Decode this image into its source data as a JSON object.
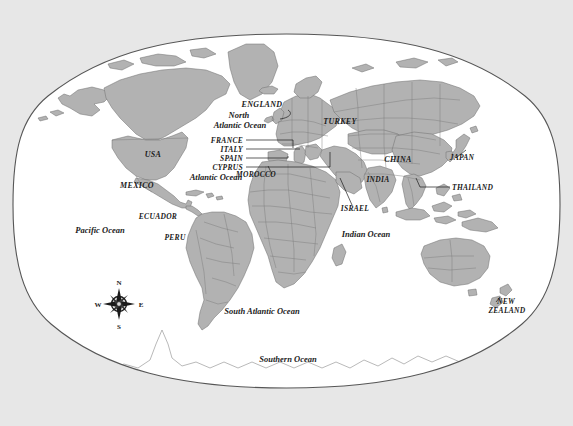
{
  "figure": {
    "kind": "world-map",
    "projection_style": "elliptical-curved-boundary",
    "background_color": "#e7e7e7",
    "ocean_color": "#ffffff",
    "land_color": "#b2b2b2",
    "land_stroke_color": "#6f6f6f",
    "border_stroke_color": "#7a7a7a",
    "boundary_stroke_color": "#565656",
    "label_color": "#1a1a1a"
  },
  "ocean_labels": [
    {
      "id": "north-atlantic-ocean",
      "lines": [
        "North",
        "Atlantic Ocean"
      ],
      "x": 240,
      "y": 118,
      "size": 8.5
    },
    {
      "id": "atlantic-ocean",
      "lines": [
        "Atlantic Ocean"
      ],
      "x": 216,
      "y": 180,
      "size": 8.5
    },
    {
      "id": "pacific-ocean",
      "lines": [
        "Pacific Ocean"
      ],
      "x": 100,
      "y": 233,
      "size": 8.5
    },
    {
      "id": "indian-ocean",
      "lines": [
        "Indian Ocean"
      ],
      "x": 366,
      "y": 237,
      "size": 8.5
    },
    {
      "id": "south-atlantic-ocean",
      "lines": [
        "South Atlantic Ocean"
      ],
      "x": 262,
      "y": 314,
      "size": 8.5
    },
    {
      "id": "southern-ocean",
      "lines": [
        "Southern Ocean"
      ],
      "x": 288,
      "y": 362,
      "size": 8.5
    }
  ],
  "country_labels": [
    {
      "id": "england",
      "lines": [
        "ENGLAND"
      ],
      "x": 262,
      "y": 107,
      "size": 8,
      "anchor": "middle"
    },
    {
      "id": "turkey",
      "lines": [
        "TURKEY"
      ],
      "x": 340,
      "y": 124,
      "size": 8,
      "anchor": "middle"
    },
    {
      "id": "france",
      "lines": [
        "FRANCE"
      ],
      "x": 243,
      "y": 143,
      "size": 7.5,
      "anchor": "end"
    },
    {
      "id": "italy",
      "lines": [
        "ITALY"
      ],
      "x": 243,
      "y": 152,
      "size": 7.5,
      "anchor": "end"
    },
    {
      "id": "spain",
      "lines": [
        "SPAIN"
      ],
      "x": 243,
      "y": 161,
      "size": 7.5,
      "anchor": "end"
    },
    {
      "id": "cyprus",
      "lines": [
        "CYPRUS"
      ],
      "x": 243,
      "y": 170,
      "size": 7.5,
      "anchor": "end"
    },
    {
      "id": "morocco",
      "lines": [
        "MOROCCO"
      ],
      "x": 256,
      "y": 177,
      "size": 7.5,
      "anchor": "middle"
    },
    {
      "id": "usa",
      "lines": [
        "USA"
      ],
      "x": 153,
      "y": 157,
      "size": 8,
      "anchor": "middle"
    },
    {
      "id": "mexico",
      "lines": [
        "MEXICO"
      ],
      "x": 137,
      "y": 188,
      "size": 8,
      "anchor": "middle"
    },
    {
      "id": "ecuador",
      "lines": [
        "ECUADOR"
      ],
      "x": 158,
      "y": 219,
      "size": 7.5,
      "anchor": "middle"
    },
    {
      "id": "peru",
      "lines": [
        "PERU"
      ],
      "x": 175,
      "y": 240,
      "size": 7.5,
      "anchor": "middle"
    },
    {
      "id": "israel",
      "lines": [
        "ISRAEL"
      ],
      "x": 355,
      "y": 211,
      "size": 7.5,
      "anchor": "middle"
    },
    {
      "id": "india",
      "lines": [
        "INDIA"
      ],
      "x": 378,
      "y": 182,
      "size": 7.5,
      "anchor": "middle"
    },
    {
      "id": "china",
      "lines": [
        "CHINA"
      ],
      "x": 398,
      "y": 162,
      "size": 8,
      "anchor": "middle"
    },
    {
      "id": "japan",
      "lines": [
        "JAPAN"
      ],
      "x": 462,
      "y": 160,
      "size": 7.5,
      "anchor": "middle"
    },
    {
      "id": "thailand",
      "lines": [
        "THAILAND"
      ],
      "x": 452,
      "y": 190,
      "size": 7.5,
      "anchor": "start"
    },
    {
      "id": "new-zealand",
      "lines": [
        "NEW",
        "ZEALAND"
      ],
      "x": 507,
      "y": 304,
      "size": 7.5,
      "anchor": "middle"
    }
  ],
  "compass": {
    "id": "compass-rose",
    "center_x": 119,
    "center_y": 304,
    "north": "N",
    "east": "E",
    "south": "S",
    "west": "W"
  }
}
